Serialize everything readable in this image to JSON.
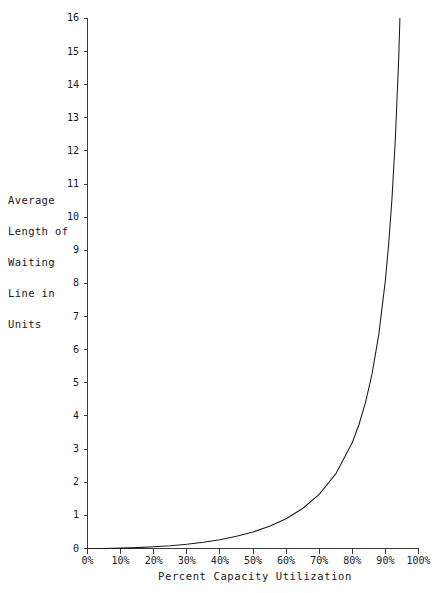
{
  "header": {
    "clipped_text": "·····························"
  },
  "axes": {
    "y_title_lines": [
      "Average",
      "Length of",
      "Waiting",
      "Line in",
      "Units"
    ],
    "x_title": "Percent Capacity Utilization",
    "y_tick_labels": [
      "0",
      "1",
      "2",
      "3",
      "4",
      "5",
      "6",
      "7",
      "8",
      "9",
      "10",
      "11",
      "12",
      "13",
      "14",
      "15",
      "16"
    ],
    "x_tick_labels": [
      "0%",
      "10%",
      "20%",
      "30%",
      "40%",
      "50%",
      "60%",
      "70%",
      "80%",
      "90%",
      "100%"
    ]
  },
  "colors": {
    "curve": "#1c1c1c",
    "axis": "#3a3a3a",
    "background": "#ffffff",
    "text": "#1a1a1a"
  },
  "chart_data": {
    "type": "line",
    "title": "",
    "subtitle": "",
    "xlabel": "Percent Capacity Utilization",
    "ylabel": "Average Length of Waiting Line in Units",
    "xlim": [
      0,
      100
    ],
    "ylim": [
      0,
      16
    ],
    "xticks": [
      0,
      10,
      20,
      30,
      40,
      50,
      60,
      70,
      80,
      90,
      100
    ],
    "xticklabels": [
      "0%",
      "10%",
      "20%",
      "30%",
      "40%",
      "50%",
      "60%",
      "70%",
      "80%",
      "90%",
      "100%"
    ],
    "yticks": [
      0,
      1,
      2,
      3,
      4,
      5,
      6,
      7,
      8,
      9,
      10,
      11,
      12,
      13,
      14,
      15,
      16
    ],
    "yticklabels": [
      "0",
      "1",
      "2",
      "3",
      "4",
      "5",
      "6",
      "7",
      "8",
      "9",
      "10",
      "11",
      "12",
      "13",
      "14",
      "15",
      "16"
    ],
    "grid": false,
    "legend": false,
    "legend_position": "none",
    "annotations": [],
    "series": [
      {
        "name": "Average length of waiting line",
        "formula": "L = rho^2 / (1 - rho)",
        "x": [
          0,
          5,
          10,
          15,
          20,
          25,
          30,
          35,
          40,
          45,
          50,
          55,
          60,
          65,
          70,
          75,
          80,
          82,
          84,
          86,
          88,
          90,
          91,
          92,
          93,
          94,
          95,
          95.5,
          96,
          96.5,
          97,
          97.3,
          97.6,
          97.9,
          98.1,
          98.3,
          98.5,
          98.7,
          98.85,
          99,
          99.1,
          99.2,
          99.3,
          99.4
        ],
        "y": [
          0,
          0.0013,
          0.011,
          0.026,
          0.05,
          0.083,
          0.129,
          0.188,
          0.267,
          0.368,
          0.5,
          0.672,
          0.9,
          1.207,
          1.633,
          2.25,
          3.2,
          3.734,
          4.41,
          5.283,
          6.453,
          8.1,
          9.201,
          10.58,
          12.35,
          14.73,
          18.05,
          20.26,
          23.04,
          26.62,
          31.36,
          35.13,
          39.77,
          45.62,
          50.55,
          56.81,
          64.48,
          74.92,
          85.28,
          98.01,
          109.01,
          122.51,
          140.3,
          164.34
        ]
      }
    ]
  }
}
